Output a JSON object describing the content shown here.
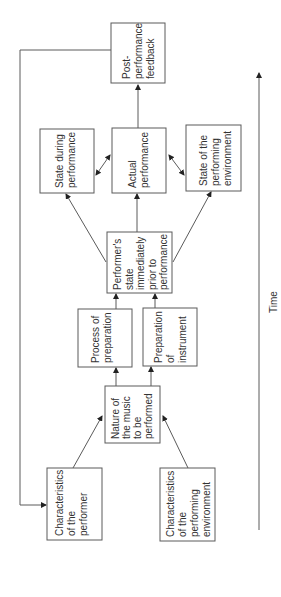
{
  "diagram": {
    "axis": {
      "label": "Time"
    },
    "nodes": {
      "post_feedback": {
        "lines": [
          "Post-",
          "performance",
          "feedback"
        ]
      },
      "state_during": {
        "lines": [
          "State during",
          "performance"
        ]
      },
      "actual_performance": {
        "lines": [
          "Actual",
          "performance"
        ]
      },
      "state_environment": {
        "lines": [
          "State of the",
          "performing",
          "environment"
        ]
      },
      "performer_state": {
        "lines": [
          "Performer's",
          "state",
          "immediately",
          "prior to",
          "performance"
        ]
      },
      "process_preparation": {
        "lines": [
          "Process of",
          "preparation"
        ]
      },
      "preparation_instrument": {
        "lines": [
          "Preparation",
          "of",
          "instrument"
        ]
      },
      "nature_music": {
        "lines": [
          "Nature of",
          "the music",
          "to be",
          "performed"
        ]
      },
      "char_performer": {
        "lines": [
          "Characteristics",
          "of the",
          "performer"
        ]
      },
      "char_environment": {
        "lines": [
          "Characteristics",
          "of the",
          "performing",
          "environment"
        ]
      }
    },
    "edges": [
      [
        "char_performer",
        "nature_music"
      ],
      [
        "char_environment",
        "nature_music"
      ],
      [
        "nature_music",
        "process_preparation"
      ],
      [
        "nature_music",
        "preparation_instrument"
      ],
      [
        "process_preparation",
        "performer_state"
      ],
      [
        "preparation_instrument",
        "performer_state"
      ],
      [
        "performer_state",
        "state_during"
      ],
      [
        "performer_state",
        "actual_performance"
      ],
      [
        "performer_state",
        "state_environment"
      ],
      [
        "actual_performance",
        "state_during",
        "bidirectional"
      ],
      [
        "actual_performance",
        "state_environment",
        "bidirectional"
      ],
      [
        "actual_performance",
        "post_feedback"
      ],
      [
        "post_feedback",
        "char_performer"
      ]
    ]
  }
}
